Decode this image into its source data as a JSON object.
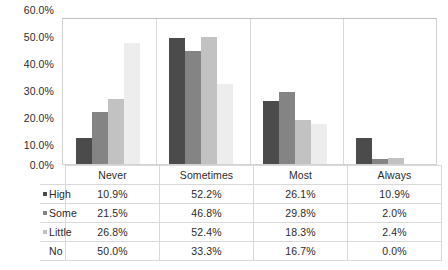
{
  "chart_data": {
    "type": "bar",
    "title": "",
    "xlabel": "",
    "ylabel": "",
    "ylim": [
      0,
      60
    ],
    "grid": false,
    "legend_position": "data-table-left",
    "categories": [
      "Never",
      "Sometimes",
      "Most",
      "Always"
    ],
    "ytick_labels": [
      "0.0%",
      "10.0%",
      "20.0%",
      "30.0%",
      "40.0%",
      "50.0%",
      "60.0%"
    ],
    "ytick_values": [
      0,
      10,
      20,
      30,
      40,
      50,
      60
    ],
    "series": [
      {
        "name": "High",
        "color": "#4b4b4b",
        "values": [
          10.9,
          52.2,
          26.1,
          10.9
        ],
        "labels": [
          "10.9%",
          "52.2%",
          "26.1%",
          "10.9%"
        ]
      },
      {
        "name": "Some",
        "color": "#848484",
        "values": [
          21.5,
          46.8,
          29.8,
          2.0
        ],
        "labels": [
          "21.5%",
          "46.8%",
          "29.8%",
          "2.0%"
        ]
      },
      {
        "name": "Little",
        "color": "#c2c2c2",
        "values": [
          26.8,
          52.4,
          18.3,
          2.4
        ],
        "labels": [
          "26.8%",
          "52.4%",
          "18.3%",
          "2.4%"
        ]
      },
      {
        "name": "No",
        "color": "#ededed",
        "values": [
          50.0,
          33.3,
          16.7,
          0.0
        ],
        "labels": [
          "50.0%",
          "33.3%",
          "16.7%",
          "0.0%"
        ]
      }
    ]
  },
  "axis": {
    "tick_0": "0.0%",
    "tick_1": "10.0%",
    "tick_2": "20.0%",
    "tick_3": "30.0%",
    "tick_4": "40.0%",
    "tick_5": "50.0%",
    "tick_6": "60.0%"
  },
  "data_table": {
    "column_headers": [
      "Never",
      "Sometimes",
      "Most",
      "Always"
    ],
    "rows": [
      {
        "label": "High",
        "swatch": "#4b4b4b",
        "has_swatch": true,
        "cells": [
          "10.9%",
          "52.2%",
          "26.1%",
          "10.9%"
        ]
      },
      {
        "label": "Some",
        "swatch": "#848484",
        "has_swatch": true,
        "cells": [
          "21.5%",
          "46.8%",
          "29.8%",
          "2.0%"
        ]
      },
      {
        "label": "Little",
        "swatch": "#c2c2c2",
        "has_swatch": true,
        "cells": [
          "26.8%",
          "52.4%",
          "18.3%",
          "2.4%"
        ]
      },
      {
        "label": "No",
        "swatch": "#ededed",
        "has_swatch": false,
        "cells": [
          "50.0%",
          "33.3%",
          "16.7%",
          "0.0%"
        ]
      }
    ]
  }
}
